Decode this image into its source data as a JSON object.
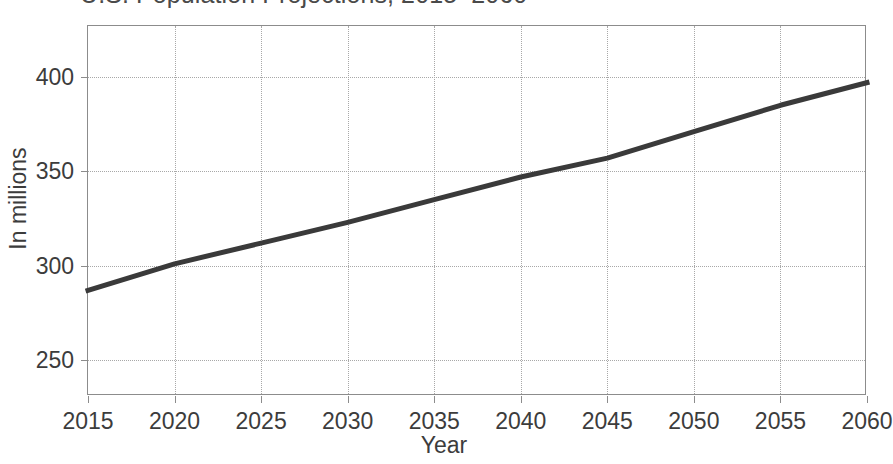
{
  "chart_data": {
    "type": "line",
    "title": "U.S. Population Projections, 2015–2060",
    "xlabel": "Year",
    "ylabel": "In millions",
    "grid": true,
    "legend": "none",
    "xlim": [
      2015,
      2060
    ],
    "ylim": [
      231,
      427
    ],
    "xticks": [
      2015,
      2020,
      2025,
      2030,
      2035,
      2040,
      2045,
      2050,
      2055,
      2060
    ],
    "xtick_labels": [
      "2015",
      "2020",
      "2025",
      "2030",
      "2035",
      "2040",
      "2045",
      "2050",
      "2055",
      "2060"
    ],
    "yticks": [
      250,
      300,
      350,
      400
    ],
    "ytick_labels": [
      "250",
      "300",
      "350",
      "400"
    ],
    "series": [
      {
        "name": "U.S. population",
        "color": "#3a3a3a",
        "line_width": 5,
        "x": [
          2015,
          2020,
          2025,
          2030,
          2035,
          2040,
          2045,
          2050,
          2055,
          2060
        ],
        "values": [
          287,
          301,
          312,
          323,
          335,
          347,
          357,
          371,
          385,
          397
        ]
      }
    ]
  },
  "figure": {
    "background_color": "#ffffff",
    "frame_color": "#8c8c8c",
    "grid_color": "#a8a8a8",
    "text_color": "#3c3c3c"
  }
}
